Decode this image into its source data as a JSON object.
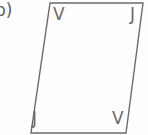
{
  "figure": {
    "part_label": "b)",
    "shape_name": "parallelogram",
    "stroke_color": "#6b6b6b",
    "background_color": "#fefefe",
    "label_color": "#6a6a6a",
    "vertices": {
      "top_left": {
        "label": "V",
        "x": 50,
        "y": 3
      },
      "top_right": {
        "label": "J",
        "x": 143,
        "y": 3
      },
      "bottom_right": {
        "label": "V",
        "x": 126,
        "y": 133
      },
      "bottom_left": {
        "label": "J",
        "x": 31,
        "y": 133
      }
    },
    "outline_points": "50,3 143,3 126,133 31,133"
  }
}
